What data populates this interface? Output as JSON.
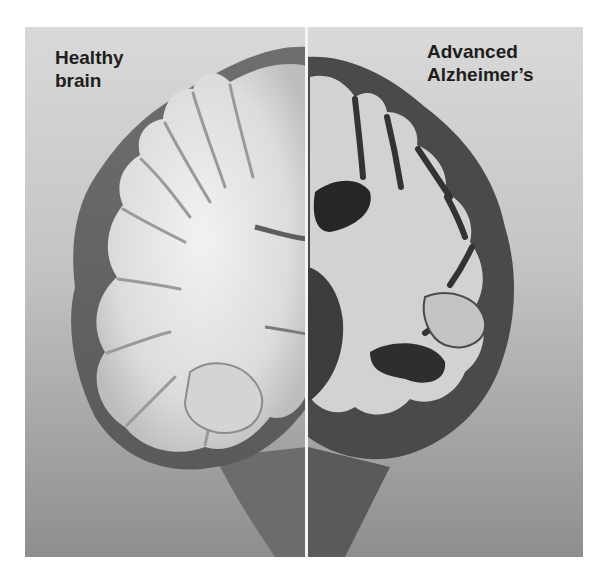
{
  "figure": {
    "caption_left": {
      "line1": "Healthy",
      "line2": "brain"
    },
    "caption_right": {
      "line1": "Advanced",
      "line2": "Alzheimer’s"
    },
    "colors": {
      "background_top": "#d9d9d9",
      "background_bottom": "#8e8e8e",
      "divider": "#f4f4f4",
      "text": "#1e1e1e",
      "white_matter": "#e6e6e6",
      "gray_matter": "#8a8a8a",
      "ventricle": "#2a2a2a"
    }
  }
}
